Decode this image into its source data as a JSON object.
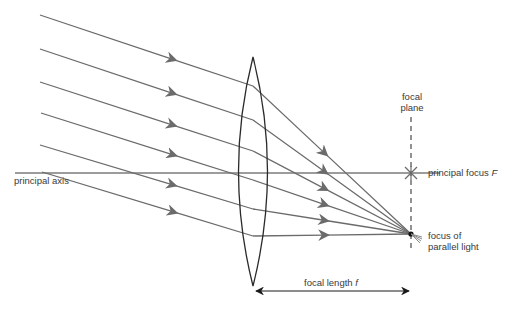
{
  "labels": {
    "principal_axis": "principal axis",
    "focal_plane_line1": "focal",
    "focal_plane_line2": "plane",
    "principal_focus": "principal focus",
    "principal_focus_symbol": "F",
    "focus_line1": "focus of",
    "focus_line2": "parallel light",
    "focal_length": "focal length",
    "focal_length_symbol": "f"
  },
  "colors": {
    "ray": "#6b6b6b",
    "lens": "#2a2a2a",
    "axis": "#3a3a3a",
    "text": "#3a3a3a"
  },
  "geometry": {
    "lens": {
      "cx": 253,
      "top": 57,
      "bottom": 286,
      "half_width": 20
    },
    "principal_axis_y": 173,
    "focal_plane_x": 411,
    "focus_point": {
      "x": 411,
      "y": 234
    },
    "principal_focus_point": {
      "x": 411,
      "y": 173
    },
    "rays": [
      {
        "start": [
          40,
          15
        ],
        "bend": [
          253,
          86
        ]
      },
      {
        "start": [
          40,
          49
        ],
        "bend": [
          253,
          120
        ]
      },
      {
        "start": [
          40,
          82
        ],
        "bend": [
          253,
          151
        ]
      },
      {
        "start": [
          41,
          113
        ],
        "bend": [
          253,
          180
        ]
      },
      {
        "start": [
          40,
          145
        ],
        "bend": [
          253,
          209
        ]
      },
      {
        "start": [
          42,
          172
        ],
        "bend": [
          253,
          236
        ]
      }
    ]
  }
}
